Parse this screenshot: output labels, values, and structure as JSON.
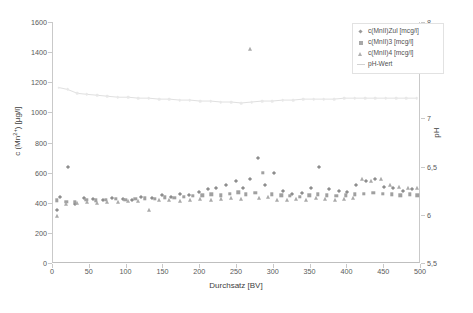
{
  "chart_data": {
    "type": "scatter",
    "title": "",
    "xlabel": "Durchsatz [BV]",
    "ylabel": "c (Mn2+) [µg/l]",
    "ylabel_right": "pH",
    "xlim": [
      0,
      500
    ],
    "ylim": [
      0,
      1600
    ],
    "ylim_right": [
      5.5,
      8
    ],
    "xticks": [
      0,
      50,
      100,
      150,
      200,
      250,
      300,
      350,
      400,
      450,
      500
    ],
    "yticks": [
      0,
      200,
      400,
      600,
      800,
      1000,
      1200,
      1400,
      1600
    ],
    "yticks_right": [
      "5,5",
      "6",
      "6,5",
      "7",
      "7,5",
      "8"
    ],
    "grid": false,
    "legend_position": "top-right",
    "series": [
      {
        "name": "c(MnII)Zul [mcg/l]",
        "marker": "diamond",
        "color": "#8d8d8d",
        "points": [
          [
            5,
            350
          ],
          [
            10,
            440
          ],
          [
            20,
            640
          ],
          [
            30,
            395
          ],
          [
            42,
            430
          ],
          [
            55,
            425
          ],
          [
            68,
            420
          ],
          [
            80,
            430
          ],
          [
            95,
            425
          ],
          [
            108,
            420
          ],
          [
            120,
            435
          ],
          [
            135,
            430
          ],
          [
            148,
            450
          ],
          [
            160,
            440
          ],
          [
            172,
            455
          ],
          [
            185,
            450
          ],
          [
            198,
            470
          ],
          [
            210,
            490
          ],
          [
            222,
            500
          ],
          [
            235,
            520
          ],
          [
            248,
            545
          ],
          [
            258,
            500
          ],
          [
            268,
            560
          ],
          [
            278,
            700
          ],
          [
            288,
            520
          ],
          [
            300,
            600
          ],
          [
            312,
            475
          ],
          [
            325,
            455
          ],
          [
            338,
            465
          ],
          [
            350,
            500
          ],
          [
            362,
            640
          ],
          [
            375,
            490
          ],
          [
            388,
            475
          ],
          [
            400,
            470
          ],
          [
            412,
            520
          ],
          [
            425,
            545
          ],
          [
            438,
            560
          ],
          [
            450,
            505
          ],
          [
            462,
            495
          ],
          [
            475,
            480
          ],
          [
            488,
            490
          ]
        ]
      },
      {
        "name": "c(MnII)3 [mcg/l]",
        "marker": "square",
        "color": "#a0a0a0",
        "points": [
          [
            5,
            415
          ],
          [
            18,
            405
          ],
          [
            30,
            408
          ],
          [
            45,
            420
          ],
          [
            58,
            415
          ],
          [
            72,
            418
          ],
          [
            85,
            425
          ],
          [
            98,
            420
          ],
          [
            112,
            425
          ],
          [
            125,
            430
          ],
          [
            138,
            425
          ],
          [
            152,
            435
          ],
          [
            165,
            432
          ],
          [
            178,
            440
          ],
          [
            190,
            445
          ],
          [
            203,
            450
          ],
          [
            215,
            455
          ],
          [
            228,
            450
          ],
          [
            240,
            460
          ],
          [
            252,
            470
          ],
          [
            262,
            455
          ],
          [
            275,
            465
          ],
          [
            285,
            600
          ],
          [
            297,
            455
          ],
          [
            310,
            450
          ],
          [
            322,
            445
          ],
          [
            335,
            440
          ],
          [
            348,
            450
          ],
          [
            360,
            455
          ],
          [
            372,
            450
          ],
          [
            385,
            445
          ],
          [
            398,
            450
          ],
          [
            410,
            455
          ],
          [
            422,
            460
          ],
          [
            435,
            465
          ],
          [
            448,
            460
          ],
          [
            460,
            455
          ],
          [
            472,
            450
          ],
          [
            485,
            455
          ],
          [
            495,
            450
          ]
        ]
      },
      {
        "name": "c(MnII)4 [mcg/l]",
        "marker": "triangle",
        "color": "#aaaaaa",
        "points": [
          [
            5,
            310
          ],
          [
            18,
            390
          ],
          [
            32,
            400
          ],
          [
            46,
            405
          ],
          [
            60,
            400
          ],
          [
            74,
            408
          ],
          [
            88,
            405
          ],
          [
            102,
            412
          ],
          [
            116,
            410
          ],
          [
            130,
            350
          ],
          [
            144,
            418
          ],
          [
            158,
            415
          ],
          [
            172,
            410
          ],
          [
            186,
            420
          ],
          [
            200,
            422
          ],
          [
            214,
            418
          ],
          [
            228,
            425
          ],
          [
            242,
            430
          ],
          [
            256,
            425
          ],
          [
            268,
            1420
          ],
          [
            280,
            430
          ],
          [
            292,
            435
          ],
          [
            305,
            420
          ],
          [
            318,
            415
          ],
          [
            330,
            425
          ],
          [
            344,
            420
          ],
          [
            357,
            430
          ],
          [
            370,
            425
          ],
          [
            383,
            420
          ],
          [
            396,
            425
          ],
          [
            408,
            430
          ],
          [
            420,
            560
          ],
          [
            432,
            545
          ],
          [
            445,
            560
          ],
          [
            458,
            520
          ],
          [
            470,
            505
          ],
          [
            482,
            500
          ],
          [
            494,
            495
          ]
        ]
      },
      {
        "name": "pH-Wert",
        "marker": "line",
        "color": "#e0e0e0",
        "points": [
          [
            8,
            7.32
          ],
          [
            20,
            7.3
          ],
          [
            33,
            7.26
          ],
          [
            46,
            7.25
          ],
          [
            60,
            7.24
          ],
          [
            74,
            7.23
          ],
          [
            88,
            7.22
          ],
          [
            102,
            7.22
          ],
          [
            116,
            7.21
          ],
          [
            130,
            7.21
          ],
          [
            144,
            7.2
          ],
          [
            158,
            7.2
          ],
          [
            172,
            7.19
          ],
          [
            186,
            7.19
          ],
          [
            200,
            7.18
          ],
          [
            214,
            7.18
          ],
          [
            228,
            7.17
          ],
          [
            242,
            7.17
          ],
          [
            256,
            7.16
          ],
          [
            270,
            7.17
          ],
          [
            284,
            7.18
          ],
          [
            298,
            7.18
          ],
          [
            312,
            7.19
          ],
          [
            326,
            7.19
          ],
          [
            340,
            7.2
          ],
          [
            354,
            7.2
          ],
          [
            368,
            7.2
          ],
          [
            382,
            7.2
          ],
          [
            396,
            7.21
          ],
          [
            410,
            7.21
          ],
          [
            424,
            7.21
          ],
          [
            438,
            7.21
          ],
          [
            452,
            7.21
          ],
          [
            466,
            7.21
          ],
          [
            480,
            7.21
          ],
          [
            494,
            7.21
          ]
        ]
      }
    ]
  },
  "legend": {
    "items": [
      {
        "label": "c(MnII)Zul [mcg/l]",
        "marker": "diamond"
      },
      {
        "label": "c(MnII)3 [mcg/l]",
        "marker": "square"
      },
      {
        "label": "c(MnII)4 [mcg/l]",
        "marker": "triangle"
      },
      {
        "label": "pH-Wert",
        "marker": "line"
      }
    ]
  }
}
